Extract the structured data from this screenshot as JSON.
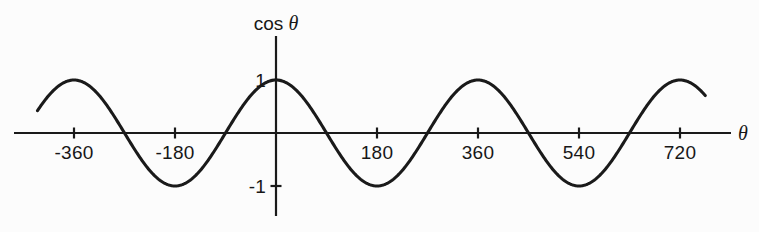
{
  "chart_data": {
    "type": "line",
    "title": "",
    "xlabel": "θ",
    "ylabel": "cos θ",
    "function": "cos",
    "x_unit": "degrees",
    "xlim": [
      -430,
      790
    ],
    "ylim": [
      -1.35,
      1.35
    ],
    "x_domain_drawn": [
      -425,
      765
    ],
    "grid": false,
    "legend": false,
    "x_ticks": [
      {
        "value": -360,
        "label": "-360"
      },
      {
        "value": -180,
        "label": "-180"
      },
      {
        "value": 180,
        "label": "180"
      },
      {
        "value": 360,
        "label": "360"
      },
      {
        "value": 540,
        "label": "540"
      },
      {
        "value": 720,
        "label": "720"
      }
    ],
    "y_ticks": [
      {
        "value": 1,
        "label": "1"
      },
      {
        "value": -1,
        "label": "-1"
      }
    ],
    "maxima": [
      {
        "x": -360,
        "y": 1
      },
      {
        "x": 0,
        "y": 1
      },
      {
        "x": 360,
        "y": 1
      },
      {
        "x": 720,
        "y": 1
      }
    ],
    "minima": [
      {
        "x": -180,
        "y": -1
      },
      {
        "x": 180,
        "y": -1
      },
      {
        "x": 540,
        "y": -1
      }
    ],
    "zero_crossings": [
      -270,
      -90,
      90,
      270,
      450,
      630
    ],
    "series": [
      {
        "name": "cos θ",
        "color": "#1a1a1a",
        "line_width": 3.1,
        "style": "solid"
      }
    ]
  },
  "axes": {
    "x_axis": {
      "name": "theta-axis",
      "color": "#1a1a1a",
      "line_width": 2.2
    },
    "y_axis": {
      "name": "cos-axis",
      "color": "#1a1a1a",
      "line_width": 2.2
    },
    "tick_length": 11,
    "tick_width": 2.2
  },
  "figure": {
    "background": "#fcfcfc",
    "ink": "#1a1a1a",
    "width": 759,
    "height": 232
  }
}
